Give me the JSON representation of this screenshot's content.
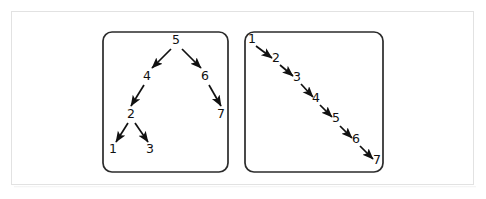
{
  "figure": {
    "background_color": "#ffffff",
    "frame_color": "#e2e2e2",
    "stroke_color": "#111111",
    "panel_border_color": "#2b2b2b"
  },
  "panels": [
    {
      "id": "balanced-tree-panel",
      "name": "balanced-binary-tree",
      "box": {
        "x": 103,
        "y": 32,
        "width": 125,
        "height": 140,
        "radius": 9
      },
      "nodes": [
        {
          "id": "n5",
          "label": "5",
          "x": 176,
          "y": 44
        },
        {
          "id": "n4",
          "label": "4",
          "x": 147,
          "y": 80
        },
        {
          "id": "n6",
          "label": "6",
          "x": 205,
          "y": 80
        },
        {
          "id": "n2",
          "label": "2",
          "x": 131,
          "y": 118
        },
        {
          "id": "n7",
          "label": "7",
          "x": 221,
          "y": 118
        },
        {
          "id": "n1",
          "label": "1",
          "x": 113,
          "y": 153
        },
        {
          "id": "n3",
          "label": "3",
          "x": 150,
          "y": 153
        }
      ],
      "edges": [
        {
          "from": "5",
          "to": "4",
          "x1": 171,
          "y1": 49,
          "x2": 152,
          "y2": 68
        },
        {
          "from": "5",
          "to": "6",
          "x1": 182,
          "y1": 49,
          "x2": 201,
          "y2": 68
        },
        {
          "from": "4",
          "to": "2",
          "x1": 144,
          "y1": 85,
          "x2": 131,
          "y2": 106
        },
        {
          "from": "6",
          "to": "7",
          "x1": 209,
          "y1": 85,
          "x2": 221,
          "y2": 106
        },
        {
          "from": "2",
          "to": "1",
          "x1": 128,
          "y1": 123,
          "x2": 116,
          "y2": 142
        },
        {
          "from": "2",
          "to": "3",
          "x1": 135,
          "y1": 123,
          "x2": 148,
          "y2": 142
        }
      ]
    },
    {
      "id": "degenerate-tree-panel",
      "name": "degenerate-linear-tree",
      "box": {
        "x": 245,
        "y": 32,
        "width": 138,
        "height": 140,
        "radius": 9
      },
      "nodes": [
        {
          "id": "d1",
          "label": "1",
          "x": 252,
          "y": 43
        },
        {
          "id": "d2",
          "label": "2",
          "x": 276,
          "y": 62
        },
        {
          "id": "d3",
          "label": "3",
          "x": 297,
          "y": 81
        },
        {
          "id": "d4",
          "label": "4",
          "x": 316,
          "y": 102
        },
        {
          "id": "d5",
          "label": "5",
          "x": 336,
          "y": 122
        },
        {
          "id": "d6",
          "label": "6",
          "x": 356,
          "y": 143
        },
        {
          "id": "d7",
          "label": "7",
          "x": 377,
          "y": 164
        }
      ],
      "edges": [
        {
          "from": "1",
          "to": "2",
          "x1": 256,
          "y1": 46,
          "x2": 272,
          "y2": 58
        },
        {
          "from": "2",
          "to": "3",
          "x1": 280,
          "y1": 65,
          "x2": 293,
          "y2": 76
        },
        {
          "from": "3",
          "to": "4",
          "x1": 301,
          "y1": 84,
          "x2": 313,
          "y2": 97
        },
        {
          "from": "4",
          "to": "5",
          "x1": 320,
          "y1": 105,
          "x2": 332,
          "y2": 117
        },
        {
          "from": "5",
          "to": "6",
          "x1": 340,
          "y1": 126,
          "x2": 352,
          "y2": 138
        },
        {
          "from": "6",
          "to": "7",
          "x1": 360,
          "y1": 146,
          "x2": 373,
          "y2": 159
        }
      ]
    }
  ]
}
